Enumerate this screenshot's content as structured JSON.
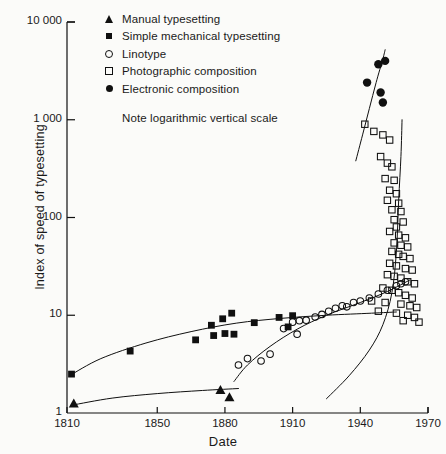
{
  "figure": {
    "background_color": "#fbfbf9",
    "ink_color": "#101010"
  },
  "legend": {
    "position": "top-left-inside",
    "note": "Note logarithmic vertical scale",
    "entries": [
      {
        "marker": "filled-triangle",
        "label": "Manual typesetting"
      },
      {
        "marker": "filled-square",
        "label": "Simple mechanical typesetting"
      },
      {
        "marker": "open-circle",
        "label": "Linotype"
      },
      {
        "marker": "open-square",
        "label": "Photographic composition"
      },
      {
        "marker": "filled-circle",
        "label": "Electronic composition"
      }
    ]
  },
  "chart_data": {
    "type": "scatter",
    "title": "",
    "subtitle": "",
    "xlabel": "Date",
    "ylabel": "Index of speed of typesetting",
    "yscale": "log",
    "xlim": [
      1810,
      1970
    ],
    "ylim": [
      1,
      10000
    ],
    "grid": false,
    "xticks": [
      1810,
      1850,
      1880,
      1910,
      1940,
      1970
    ],
    "xtick_labels": [
      "1810",
      "1850",
      "1880",
      "1910",
      "1940",
      "1970"
    ],
    "yticks": [
      1,
      10,
      100,
      1000,
      10000
    ],
    "ytick_labels": [
      "1",
      "10",
      "100",
      "1 000",
      "10 000"
    ],
    "annotations": [
      "Note logarithmic vertical scale"
    ],
    "series": [
      {
        "name": "Manual typesetting",
        "marker": "filled-triangle",
        "points": [
          [
            1813,
            1.25
          ],
          [
            1878,
            1.72
          ],
          [
            1882,
            1.45
          ]
        ],
        "trend": [
          [
            1812,
            1.2
          ],
          [
            1830,
            1.42
          ],
          [
            1850,
            1.58
          ],
          [
            1870,
            1.7
          ],
          [
            1886,
            1.78
          ]
        ]
      },
      {
        "name": "Simple mechanical typesetting",
        "marker": "filled-square",
        "points": [
          [
            1812,
            2.5
          ],
          [
            1838,
            4.3
          ],
          [
            1867,
            5.6
          ],
          [
            1874,
            7.9
          ],
          [
            1875,
            6.2
          ],
          [
            1879,
            9.2
          ],
          [
            1880,
            6.5
          ],
          [
            1883,
            10.5
          ],
          [
            1884,
            6.4
          ],
          [
            1893,
            8.4
          ],
          [
            1904,
            9.5
          ],
          [
            1908,
            7.6
          ],
          [
            1910,
            9.9
          ]
        ],
        "trend": [
          [
            1811,
            2.4
          ],
          [
            1825,
            3.6
          ],
          [
            1845,
            5.2
          ],
          [
            1865,
            6.8
          ],
          [
            1885,
            8.3
          ],
          [
            1905,
            9.3
          ],
          [
            1925,
            10.0
          ],
          [
            1945,
            10.5
          ],
          [
            1956,
            10.8
          ]
        ]
      },
      {
        "name": "Linotype",
        "marker": "open-circle",
        "points": [
          [
            1886,
            3.1
          ],
          [
            1890,
            3.6
          ],
          [
            1896,
            3.4
          ],
          [
            1900,
            4.0
          ],
          [
            1906,
            7.3
          ],
          [
            1910,
            8.5
          ],
          [
            1913,
            8.8
          ],
          [
            1916,
            8.9
          ],
          [
            1912,
            6.4
          ],
          [
            1920,
            9.6
          ],
          [
            1923,
            10.2
          ],
          [
            1926,
            11.0
          ],
          [
            1929,
            11.8
          ],
          [
            1932,
            12.5
          ],
          [
            1934,
            12.2
          ],
          [
            1937,
            13.5
          ],
          [
            1940,
            14.0
          ],
          [
            1944,
            15.0
          ],
          [
            1948,
            16.5
          ],
          [
            1952,
            18.0
          ],
          [
            1956,
            20.0
          ],
          [
            1958,
            21.0
          ],
          [
            1960,
            22.0
          ]
        ],
        "trend": [
          [
            1884,
            2.1
          ],
          [
            1890,
            3.1
          ],
          [
            1900,
            4.8
          ],
          [
            1912,
            7.2
          ],
          [
            1925,
            10.0
          ],
          [
            1940,
            13.5
          ],
          [
            1952,
            17.5
          ],
          [
            1962,
            23.0
          ]
        ]
      },
      {
        "name": "Photographic composition",
        "marker": "open-square",
        "points": [
          [
            1942,
            900
          ],
          [
            1946,
            760
          ],
          [
            1950,
            700
          ],
          [
            1953,
            620
          ],
          [
            1949,
            420
          ],
          [
            1952,
            360
          ],
          [
            1954,
            330
          ],
          [
            1951,
            250
          ],
          [
            1955,
            240
          ],
          [
            1953,
            190
          ],
          [
            1956,
            175
          ],
          [
            1952,
            150
          ],
          [
            1957,
            140
          ],
          [
            1954,
            120
          ],
          [
            1958,
            115
          ],
          [
            1955,
            95
          ],
          [
            1959,
            90
          ],
          [
            1956,
            80
          ],
          [
            1953,
            72
          ],
          [
            1957,
            66
          ],
          [
            1960,
            62
          ],
          [
            1955,
            55
          ],
          [
            1958,
            52
          ],
          [
            1961,
            50
          ],
          [
            1954,
            45
          ],
          [
            1957,
            42
          ],
          [
            1959,
            40
          ],
          [
            1962,
            38
          ],
          [
            1953,
            34
          ],
          [
            1956,
            32
          ],
          [
            1960,
            30
          ],
          [
            1963,
            29
          ],
          [
            1952,
            26
          ],
          [
            1955,
            25
          ],
          [
            1958,
            24
          ],
          [
            1961,
            22
          ],
          [
            1964,
            21
          ],
          [
            1950,
            19
          ],
          [
            1954,
            18
          ],
          [
            1957,
            17
          ],
          [
            1960,
            16
          ],
          [
            1963,
            15
          ],
          [
            1945,
            14
          ],
          [
            1951,
            13.5
          ],
          [
            1958,
            13
          ],
          [
            1962,
            12.5
          ],
          [
            1965,
            12
          ],
          [
            1948,
            11
          ],
          [
            1956,
            10.5
          ],
          [
            1961,
            10
          ],
          [
            1964,
            9.5
          ],
          [
            1959,
            8.8
          ],
          [
            1966,
            8.5
          ]
        ],
        "trend": [
          [
            1925,
            1.4
          ],
          [
            1935,
            2.4
          ],
          [
            1944,
            4.4
          ],
          [
            1950,
            8.0
          ],
          [
            1954,
            17.0
          ],
          [
            1956,
            45.0
          ],
          [
            1957,
            150.0
          ],
          [
            1958,
            420.0
          ],
          [
            1958.5,
            1000.0
          ]
        ]
      },
      {
        "name": "Electronic composition",
        "marker": "filled-circle",
        "points": [
          [
            1943,
            2400
          ],
          [
            1948,
            3700
          ],
          [
            1951,
            4000
          ],
          [
            1949,
            1900
          ],
          [
            1950,
            1500
          ]
        ],
        "trend": [
          [
            1938,
            380
          ],
          [
            1941,
            700
          ],
          [
            1944,
            1300
          ],
          [
            1947,
            2400
          ],
          [
            1950,
            4200
          ],
          [
            1951,
            5200
          ]
        ]
      }
    ]
  }
}
